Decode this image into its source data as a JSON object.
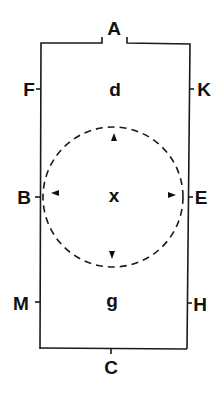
{
  "diagram": {
    "colors": {
      "line": "#1a1a1a",
      "text": "#111111",
      "background": "#ffffff"
    },
    "labels": {
      "top_opening": "A",
      "bottom": "C",
      "left_top": "F",
      "left_middle": "B",
      "left_bottom": "M",
      "right_top": "K",
      "right_middle": "E",
      "right_bottom": "H",
      "upper_region": "d",
      "center": "x",
      "lower_region": "g"
    },
    "circle": {
      "style": "dashed",
      "arrows": [
        "up",
        "down",
        "left",
        "right"
      ]
    }
  }
}
